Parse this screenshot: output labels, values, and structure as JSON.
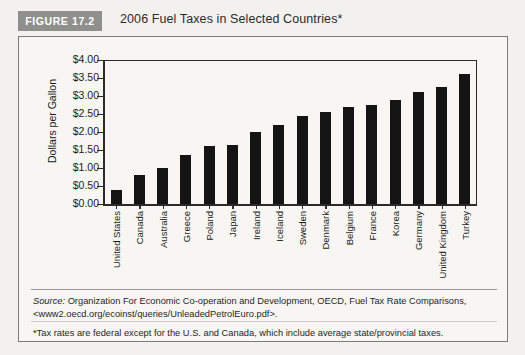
{
  "figure": {
    "badge": "FIGURE 17.2",
    "title": "2006 Fuel Taxes in Selected Countries*"
  },
  "notes": {
    "source_label": "Source:",
    "source_text": " Organization For Economic Co-operation and Development, OECD, Fuel Tax Rate Comparisons,",
    "source_url": "<www2.oecd.org/ecoinst/queries/UnleadedPetrolEuro.pdf>.",
    "footnote": "*Tax rates are federal except for the U.S. and Canada, which include average state/provincial taxes."
  },
  "chart_data": {
    "type": "bar",
    "title": "2006 Fuel Taxes in Selected Countries*",
    "xlabel": "",
    "ylabel": "Dollars per Gallon",
    "ylim": [
      0,
      4.0
    ],
    "ytick_step": 0.5,
    "ytick_labels": [
      "$4.00",
      "$3.50",
      "$3.00",
      "$2.50",
      "$2.00",
      "$1.50",
      "$1.00",
      "$0.50",
      "$0.00"
    ],
    "grid": false,
    "legend": null,
    "bar_color": "#141414",
    "categories": [
      "United States",
      "Canada",
      "Australia",
      "Greece",
      "Poland",
      "Japan",
      "Ireland",
      "Iceland",
      "Sweden",
      "Denmark",
      "Belgium",
      "France",
      "Korea",
      "Germany",
      "United Kingdom",
      "Turkey"
    ],
    "values": [
      0.4,
      0.8,
      1.0,
      1.35,
      1.6,
      1.65,
      2.0,
      2.2,
      2.45,
      2.55,
      2.7,
      2.75,
      2.9,
      3.1,
      3.25,
      3.6
    ]
  },
  "colors": {
    "badge_background": "#8f8f8c",
    "badge_text": "#ffffff",
    "panel_background": "#f7f6f2",
    "page_background": "#f2f1ed",
    "axis": "#2b2b2b"
  }
}
